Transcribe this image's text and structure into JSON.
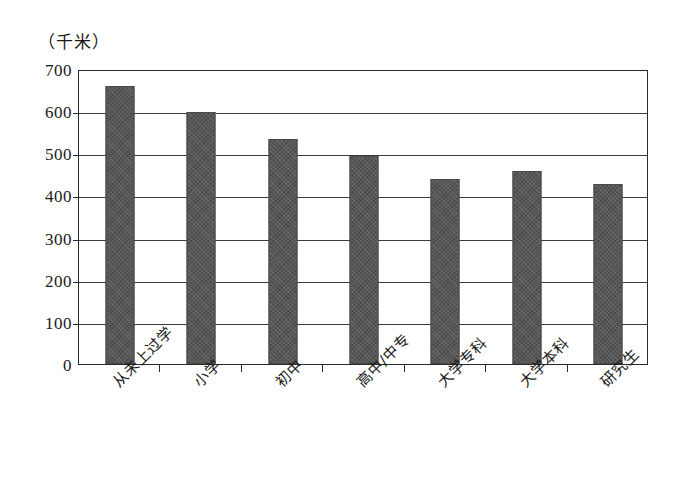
{
  "chart_data": {
    "type": "bar",
    "title": "",
    "subtitle": "",
    "xlabel": "",
    "ylabel": "（千米）",
    "ylim": [
      0,
      700
    ],
    "ytick_step": 100,
    "yticks": [
      "0",
      "100",
      "200",
      "300",
      "400",
      "500",
      "600",
      "700"
    ],
    "grid": true,
    "legend": "none",
    "bar_color": "#575757",
    "axis_color": "#2a2a2a",
    "categories": [
      "从未上过学",
      "小学",
      "初中",
      "高中/中专",
      "大学专科",
      "大学本科",
      "研究生"
    ],
    "values": [
      660,
      598,
      533,
      493,
      440,
      457,
      427
    ]
  },
  "axis": {
    "unit_label": "（千米）"
  }
}
